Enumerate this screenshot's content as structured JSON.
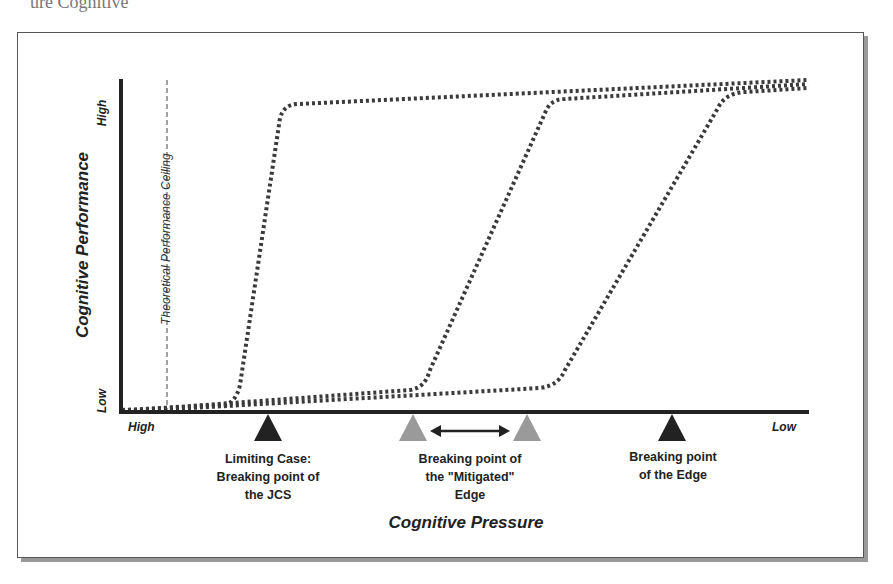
{
  "page": {
    "top_fragment": "ure   Cognitive"
  },
  "diagram": {
    "y_axis": {
      "title": "Cognitive Performance",
      "high_label": "High",
      "low_label": "Low"
    },
    "x_axis": {
      "title": "Cognitive Pressure",
      "high_label": "High",
      "low_label": "Low"
    },
    "ceiling_label": "Theoretical Performance Ceiling",
    "markers": [
      {
        "id": "jcs",
        "label_lines": [
          "Limiting Case:",
          "Breaking point of",
          "the JCS"
        ],
        "color": "#222222"
      },
      {
        "id": "mitigated",
        "label_lines": [
          "Breaking point of",
          "the \"Mitigated\"",
          "Edge"
        ],
        "color": "#999999"
      },
      {
        "id": "edge",
        "label_lines": [
          "Breaking point",
          "of the Edge"
        ],
        "color": "#222222"
      }
    ],
    "curves": [
      {
        "name": "Limiting Case (JCS)",
        "style": "dotted"
      },
      {
        "name": "Mitigated Edge",
        "style": "dotted"
      },
      {
        "name": "Edge",
        "style": "dotted"
      }
    ],
    "colors": {
      "axis": "#222222",
      "curve": "#3a3a3a",
      "marker_dark": "#222222",
      "marker_light": "#9a9a9a",
      "frame": "#555555",
      "shadow": "#9a9a9a"
    }
  }
}
